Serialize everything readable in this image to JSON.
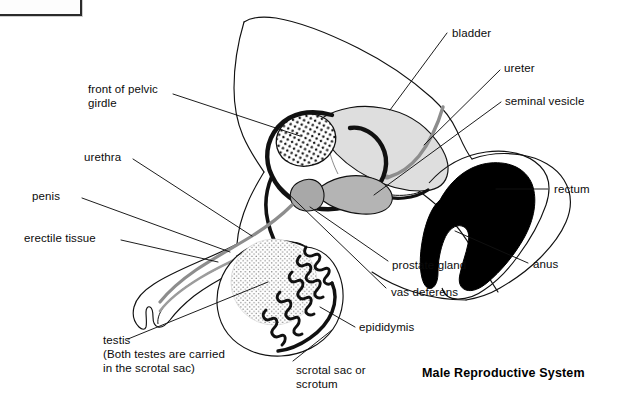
{
  "figure": {
    "title": "Male Reproductive System",
    "kind": "anatomical-diagram"
  },
  "labels": {
    "front_of_pelvic_girdle_line1": "front of pelvic",
    "front_of_pelvic_girdle_line2": "girdle",
    "urethra": "urethra",
    "penis": "penis",
    "erectile_tissue": "erectile tissue",
    "testis_line1": "testis",
    "testis_line2": "(Both testes are carried",
    "testis_line3": "in the scrotal sac)",
    "scrotal_sac_line1": "scrotal sac or",
    "scrotal_sac_line2": "scrotum",
    "epididymis": "epididymis",
    "vas_deferens": "vas deferens",
    "prostate_gland": "prostate gland",
    "anus": "anus",
    "rectum": "rectum",
    "seminal_vesicle": "seminal vesicle",
    "ureter": "ureter",
    "bladder": "bladder"
  },
  "colors": {
    "ink": "#111111",
    "bladder_fill": "#dedede",
    "prostate_fill": "#a8a8a8",
    "seminal_vesicle_fill": "#b4b4b4",
    "rectum_fill": "#000000",
    "urethra_stroke": "#8d8d8d",
    "ureter_stroke": "#8d8d8d",
    "testis_stipple": "#7a7a7a",
    "page_background": "#ffffff"
  },
  "structures": [
    "front of pelvic girdle",
    "urethra",
    "penis",
    "erectile tissue",
    "testis",
    "scrotal sac or scrotum",
    "epididymis",
    "vas deferens",
    "prostate gland",
    "anus",
    "rectum",
    "seminal vesicle",
    "ureter",
    "bladder"
  ]
}
